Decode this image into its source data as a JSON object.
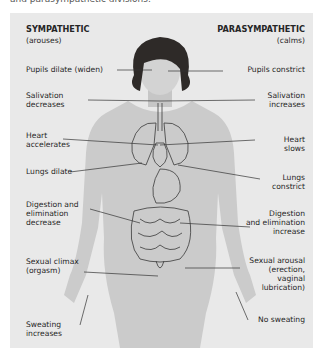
{
  "caption": "and parasympathetic divisions.",
  "diagram": {
    "sympathetic": {
      "title": "SYMPATHETIC",
      "subtitle": "(arouses)",
      "effects": [
        {
          "id": "pupils",
          "lines": [
            "Pupils dilate (widen)"
          ]
        },
        {
          "id": "salivation",
          "lines": [
            "Salivation",
            "decreases"
          ]
        },
        {
          "id": "heart",
          "lines": [
            "Heart",
            "accelerates"
          ]
        },
        {
          "id": "lungs",
          "lines": [
            "Lungs dilate"
          ]
        },
        {
          "id": "digestion",
          "lines": [
            "Digestion and",
            "elimination",
            "decrease"
          ]
        },
        {
          "id": "sexual",
          "lines": [
            "Sexual climax",
            "(orgasm)"
          ]
        },
        {
          "id": "sweating",
          "lines": [
            "Sweating",
            "increases"
          ]
        }
      ]
    },
    "parasympathetic": {
      "title": "PARASYMPATHETIC",
      "subtitle": "(calms)",
      "effects": [
        {
          "id": "pupils",
          "lines": [
            "Pupils constrict"
          ]
        },
        {
          "id": "salivation",
          "lines": [
            "Salivation",
            "increases"
          ]
        },
        {
          "id": "heart",
          "lines": [
            "Heart",
            "slows"
          ]
        },
        {
          "id": "lungs",
          "lines": [
            "Lungs",
            "constrict"
          ]
        },
        {
          "id": "digestion",
          "lines": [
            "Digestion",
            "and elimination",
            "increase"
          ]
        },
        {
          "id": "sexual",
          "lines": [
            "Sexual arousal",
            "(erection,",
            "vaginal",
            "lubrication)"
          ]
        },
        {
          "id": "sweating",
          "lines": [
            "No sweating"
          ]
        }
      ]
    },
    "colors": {
      "panel": "#e9e9e9",
      "skin": "#c9c9c9",
      "hair": "#2e2a28",
      "line": "#333333",
      "text": "#262626"
    }
  }
}
